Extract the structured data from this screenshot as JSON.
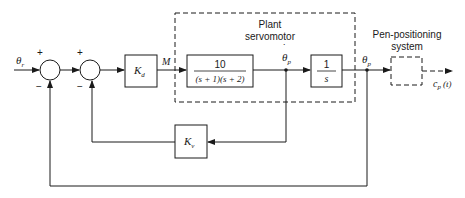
{
  "diagram": {
    "type": "block-diagram",
    "input_label": "θ",
    "input_sub": "r",
    "output_label": "c",
    "output_sub": "p",
    "output_arg": "(t)",
    "junction1": {
      "plus": "+",
      "minus": "−"
    },
    "junction2": {
      "plus": "+",
      "minus": "−"
    },
    "kd_block": {
      "main": "K",
      "sub": "d"
    },
    "signal_m": "M",
    "plant_group": {
      "title_line1": "Plant",
      "title_line2": "servomotor"
    },
    "tf_block": {
      "numerator": "10",
      "denominator": "(s + 1)(s + 2)"
    },
    "velocity_signal": {
      "main": "θ",
      "sub": "p",
      "dot": "˙"
    },
    "integrator_block": {
      "numerator": "1",
      "denominator": "s"
    },
    "position_signal": {
      "main": "θ",
      "sub": "p"
    },
    "pen_group": {
      "title_line1": "Pen-positioning",
      "title_line2": "system"
    },
    "kv_block": {
      "main": "K",
      "sub": "v"
    },
    "colors": {
      "line": "#1a1a1a",
      "background": "#ffffff"
    }
  }
}
